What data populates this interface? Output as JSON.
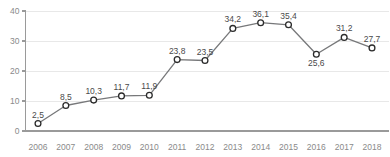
{
  "chart_data": {
    "type": "line",
    "title": "",
    "subtitle": "",
    "xlabel": "",
    "ylabel": "",
    "categories": [
      "2006",
      "2007",
      "2008",
      "2009",
      "2010",
      "2011",
      "2012",
      "2013",
      "2014",
      "2015",
      "2016",
      "2017",
      "2018"
    ],
    "values": [
      2.5,
      8.5,
      10.3,
      11.7,
      11.9,
      23.8,
      23.5,
      34.2,
      36.1,
      35.4,
      25.6,
      31.2,
      27.7
    ],
    "data_labels": [
      "2,5",
      "8,5",
      "10,3",
      "11,7",
      "11,9",
      "23,8",
      "23,5",
      "34,2",
      "36,1",
      "35,4",
      "25,6",
      "31,2",
      "27,7"
    ],
    "label_positions": [
      "above",
      "above",
      "above",
      "above",
      "above",
      "above",
      "above",
      "above",
      "above",
      "above",
      "below",
      "above",
      "above"
    ],
    "ylim": [
      0,
      40
    ],
    "y_ticks": [
      0,
      10,
      20,
      30,
      40
    ],
    "y_tick_labels": [
      "0",
      "10",
      "20",
      "30",
      "40"
    ],
    "grid": true,
    "grid_axis": "y",
    "legend": false,
    "legend_position": "none",
    "series": [
      {
        "name": "",
        "values": [
          2.5,
          8.5,
          10.3,
          11.7,
          11.9,
          23.8,
          23.5,
          34.2,
          36.1,
          35.4,
          25.6,
          31.2,
          27.7
        ]
      }
    ]
  },
  "colors": {
    "line": "#77787a",
    "marker_fill": "#ffffff",
    "marker_stroke": "#2b2b2b",
    "grid": "#e8e8e8",
    "axis": "#9a9a9a",
    "tick_text": "#8a8a8a",
    "value_text": "#4a4a4a",
    "background": "#ffffff"
  }
}
